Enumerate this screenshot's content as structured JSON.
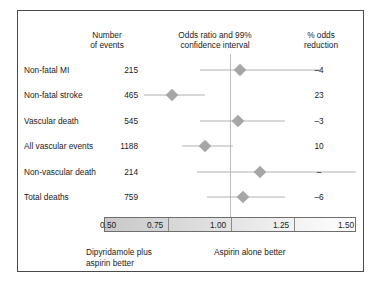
{
  "headers": {
    "events": "Number\nof events",
    "odds_ratio": "Odds ratio and 99%\nconfidence interval",
    "reduction": "% odds\nreduction"
  },
  "footer": {
    "left": "Dipyridamole plus\naspirin better",
    "right": "Aspirin alone better"
  },
  "axis": {
    "ticks": [
      "0.50",
      "0.75",
      "1.00",
      "1.25",
      "1.50"
    ],
    "min": 0.5,
    "max": 1.5,
    "reference": 1.0
  },
  "chart_data": {
    "type": "forest",
    "title": "Odds ratio and 99% confidence interval",
    "xlabel": "Odds ratio",
    "xlim": [
      0.5,
      1.5
    ],
    "reference_line": 1.0,
    "grid": false,
    "left_favors": "Dipyridamole plus aspirin better",
    "right_favors": "Aspirin alone better",
    "columns": [
      "Outcome",
      "Number of events",
      "Odds ratio and 99% confidence interval",
      "% odds reduction"
    ],
    "rows": [
      {
        "label": "Non-fatal MI",
        "events": "215",
        "or": 1.04,
        "ci_low": 0.88,
        "ci_high": 1.36,
        "reduction": "–4"
      },
      {
        "label": "Non-fatal stroke",
        "events": "465",
        "or": 0.77,
        "ci_low": 0.66,
        "ci_high": 0.9,
        "reduction": "23"
      },
      {
        "label": "Vascular death",
        "events": "545",
        "or": 1.03,
        "ci_low": 0.88,
        "ci_high": 1.22,
        "reduction": "–3"
      },
      {
        "label": "All vascular events",
        "events": "1188",
        "or": 0.9,
        "ci_low": 0.81,
        "ci_high": 1.01,
        "reduction": "10"
      },
      {
        "label": "Non-vascular death",
        "events": "214",
        "or": 1.12,
        "ci_low": 0.87,
        "ci_high": 1.5,
        "reduction": "–"
      },
      {
        "label": "Total deaths",
        "events": "759",
        "or": 1.05,
        "ci_low": 0.91,
        "ci_high": 1.22,
        "reduction": "–6"
      }
    ]
  }
}
